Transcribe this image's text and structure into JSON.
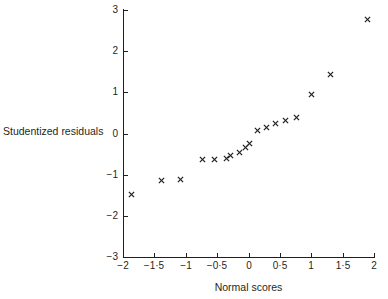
{
  "chart_data": {
    "type": "scatter",
    "title": "",
    "xlabel": "Normal scores",
    "ylabel": "Studentized residuals",
    "xlim": [
      -2,
      2
    ],
    "ylim": [
      -3,
      3
    ],
    "grid": false,
    "legend": null,
    "marker": "x",
    "marker_color": "#1f1f1f",
    "xticks": [
      -2,
      -1.5,
      -1,
      -0.5,
      0,
      0.5,
      1,
      1.5,
      2
    ],
    "xticklabels": [
      "−2",
      "−1·5",
      "−1",
      "−0·5",
      "0",
      "0·5",
      "1",
      "1·5",
      "2"
    ],
    "yticks": [
      -3,
      -2,
      -1,
      0,
      1,
      2,
      3
    ],
    "yticklabels": [
      "−3",
      "−2",
      "−1",
      "0",
      "1",
      "2",
      "3"
    ],
    "points": [
      {
        "x": -1.87,
        "y": -1.47
      },
      {
        "x": -1.39,
        "y": -1.13
      },
      {
        "x": -1.08,
        "y": -1.11
      },
      {
        "x": -0.73,
        "y": -0.63
      },
      {
        "x": -0.54,
        "y": -0.62
      },
      {
        "x": -0.35,
        "y": -0.61
      },
      {
        "x": -0.28,
        "y": -0.53
      },
      {
        "x": -0.14,
        "y": -0.45
      },
      {
        "x": -0.05,
        "y": -0.34
      },
      {
        "x": 0.02,
        "y": -0.25
      },
      {
        "x": 0.14,
        "y": 0.08
      },
      {
        "x": 0.29,
        "y": 0.15
      },
      {
        "x": 0.43,
        "y": 0.25
      },
      {
        "x": 0.59,
        "y": 0.31
      },
      {
        "x": 0.77,
        "y": 0.4
      },
      {
        "x": 1.01,
        "y": 0.94
      },
      {
        "x": 1.31,
        "y": 1.44
      },
      {
        "x": 1.89,
        "y": 2.78
      }
    ]
  }
}
